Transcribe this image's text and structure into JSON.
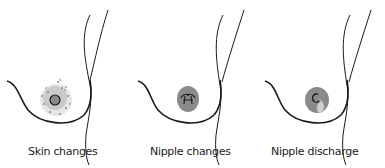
{
  "panels": [
    {
      "id": "skin",
      "label": "Skin changes",
      "icon": "skin-changes-icon"
    },
    {
      "id": "nipple",
      "label": "Nipple changes",
      "icon": "nipple-changes-icon"
    },
    {
      "id": "discharge",
      "label": "Nipple discharge",
      "icon": "nipple-discharge-icon"
    }
  ],
  "colors": {
    "outline": "#1a1a1a",
    "areola": "#8a8a8a",
    "speckle": "#9a9a9a",
    "discharge": "#c8c8c8"
  }
}
